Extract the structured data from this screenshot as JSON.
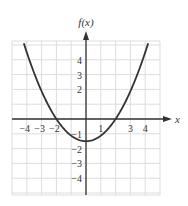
{
  "chart_data": {
    "type": "line",
    "title": "",
    "xlabel": "x",
    "ylabel": "f(x)",
    "xlim": [
      -5,
      5
    ],
    "ylim": [
      -5,
      5.3
    ],
    "grid": true,
    "legend": null,
    "x_tick_labels": [
      "-4",
      "-3",
      "-2",
      "1",
      "3",
      "4"
    ],
    "x_tick_values": [
      -4,
      -3,
      -2,
      1,
      3,
      4
    ],
    "y_tick_labels": [
      "4",
      "3",
      "2",
      "-1",
      "-2",
      "-3",
      "-4"
    ],
    "y_tick_values": [
      4,
      3,
      2,
      -1,
      -2,
      -3,
      -4
    ],
    "series": [
      {
        "name": "f(x)",
        "function": "0.375*x^2 - 1.5",
        "x": [
          -4.1,
          -4,
          -3,
          -2,
          -1,
          0,
          1,
          2,
          3,
          4,
          4.1
        ],
        "values": [
          4.8,
          4.5,
          1.875,
          0,
          -1.125,
          -1.5,
          -1.125,
          0,
          1.875,
          4.5,
          4.8
        ]
      }
    ],
    "annotations": {
      "vertex": [
        0,
        -1.5
      ],
      "x_intercepts": [
        -2,
        2
      ]
    }
  },
  "colors": {
    "axis": "#333333",
    "curve": "#333333",
    "grid": "#dddddd"
  }
}
